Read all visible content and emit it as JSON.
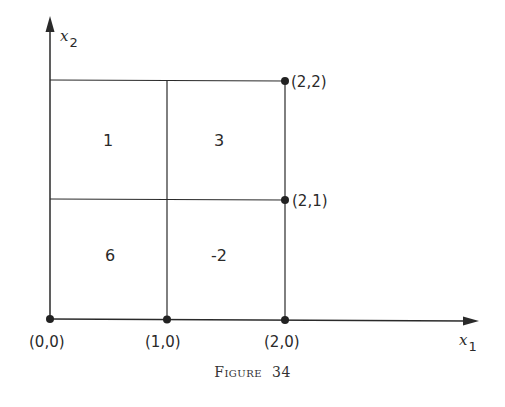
{
  "figure": {
    "caption_word": "Figure",
    "caption_number": "34",
    "x_axis_label": "x",
    "x_axis_subscript": "1",
    "y_axis_label": "x",
    "y_axis_subscript": "2"
  },
  "points": [
    {
      "label": "(0,0)",
      "x": 0,
      "y": 0
    },
    {
      "label": "(1,0)",
      "x": 1,
      "y": 0
    },
    {
      "label": "(2,0)",
      "x": 2,
      "y": 0
    },
    {
      "label": "(2,1)",
      "x": 2,
      "y": 1
    },
    {
      "label": "(2,2)",
      "x": 2,
      "y": 2
    }
  ],
  "cells": [
    {
      "region": "[0,1]x[1,2]",
      "value": "1"
    },
    {
      "region": "[1,2]x[1,2]",
      "value": "3"
    },
    {
      "region": "[0,1]x[0,1]",
      "value": "6"
    },
    {
      "region": "[1,2]x[0,1]",
      "value": "-2"
    }
  ],
  "colors": {
    "line": "#2a2a2a",
    "background": "#ffffff"
  }
}
